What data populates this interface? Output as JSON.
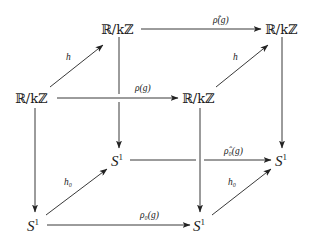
{
  "diagram": {
    "type": "commutative-cube",
    "nodes": {
      "top_back_left": {
        "label": "ℝ/kℤ"
      },
      "top_back_right": {
        "label": "ℝ/kℤ"
      },
      "top_front_left": {
        "label": "ℝ/kℤ"
      },
      "top_front_right": {
        "label": "ℝ/kℤ"
      },
      "bottom_back_left": {
        "base": "S",
        "sup": "1"
      },
      "bottom_back_right": {
        "base": "S",
        "sup": "1"
      },
      "bottom_front_left": {
        "base": "S",
        "sup": "1"
      },
      "bottom_front_right": {
        "base": "S",
        "sup": "1"
      }
    },
    "edges": {
      "top_back": {
        "label": "ρ̂(g)"
      },
      "top_front": {
        "label": "ρ(g)"
      },
      "top_left_diag": {
        "label": "h"
      },
      "top_right_diag": {
        "label": "h"
      },
      "bottom_back": {
        "label": "ρ̂₀(g)"
      },
      "bottom_front": {
        "label": "ρ₀(g)"
      },
      "bottom_left_diag": {
        "label": "h₀"
      },
      "bottom_right_diag": {
        "label": "h₀"
      }
    }
  }
}
